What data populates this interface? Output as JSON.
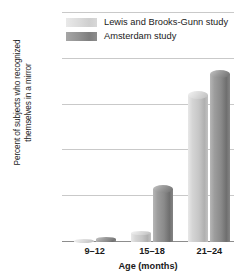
{
  "chart_data": {
    "type": "bar",
    "title": "",
    "xlabel": "Age (months)",
    "ylabel_line1": "Percent of subjects who recognized",
    "ylabel_line2": "themselves in a mirror",
    "categories": [
      "9–12",
      "15–18",
      "21–24"
    ],
    "series": [
      {
        "name": "Lewis and Brooks-Gunn study",
        "values": [
          1,
          5,
          66
        ],
        "color": "#d0d0d0"
      },
      {
        "name": "Amsterdam study",
        "values": [
          2,
          25,
          75
        ],
        "color": "#8a8a8a"
      }
    ],
    "ylim": [
      0,
      100
    ],
    "yticks": [
      "0",
      "20",
      "40",
      "60",
      "80",
      "100"
    ],
    "ytick_values": [
      0,
      20,
      40,
      60,
      80,
      100
    ],
    "grid": true,
    "legend_position": "top-center"
  }
}
